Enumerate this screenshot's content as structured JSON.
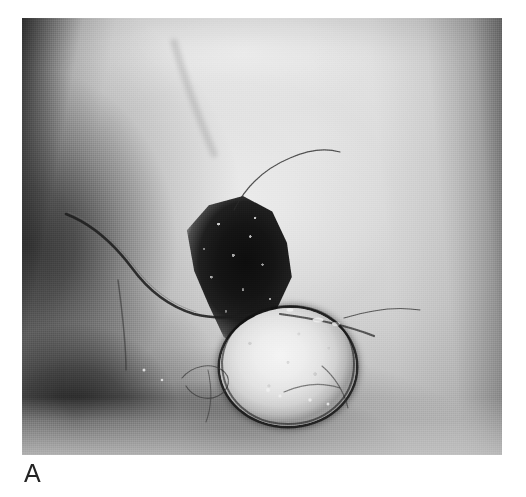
{
  "figure": {
    "panel_label": "A",
    "caption_text": "",
    "photo": {
      "type": "clinical-photograph",
      "color_mode": "grayscale",
      "subject": "breast reconstruction - nipple-areola complex",
      "frame": {
        "x": 22,
        "y": 18,
        "width": 480,
        "height": 437
      }
    },
    "features": [
      {
        "name": "eschar",
        "label": "dark crusted eschar over flap",
        "tone": "#141414"
      },
      {
        "name": "nipple-areola-graft",
        "label": "circular skin graft",
        "tone": "#ededed"
      },
      {
        "name": "mastectomy-scar",
        "label": "curved scar line",
        "tone": "#2a2a2a"
      },
      {
        "name": "inframammary-fold",
        "label": "inframammary fold shadow",
        "tone": "#1a1a1a"
      },
      {
        "name": "suture-threads",
        "label": "suture threads",
        "tone": "#303030"
      }
    ],
    "palette": {
      "background": "#ffffff",
      "highlight": "#f2f2f2",
      "midtone": "#b9b9b9",
      "shadow": "#2b2b2b",
      "deep_shadow": "#101010",
      "label_color": "#242424"
    }
  }
}
